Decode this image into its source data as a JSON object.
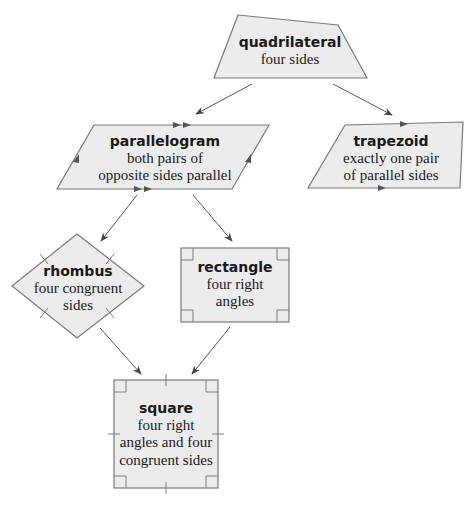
{
  "colors": {
    "fill": "#ececec",
    "stroke": "#7a7a7a",
    "arrow": "#555555",
    "text": "#1a1a1a"
  },
  "nodes": {
    "quadrilateral": {
      "title": "quadrilateral",
      "desc": [
        "four sides"
      ]
    },
    "parallelogram": {
      "title": "parallelogram",
      "desc": [
        "both pairs of",
        "opposite sides parallel"
      ]
    },
    "trapezoid": {
      "title": "trapezoid",
      "desc": [
        "exactly one pair",
        "of parallel sides"
      ]
    },
    "rhombus": {
      "title": "rhombus",
      "desc": [
        "four congruent",
        "sides"
      ]
    },
    "rectangle": {
      "title": "rectangle",
      "desc": [
        "four right",
        "angles"
      ]
    },
    "square": {
      "title": "square",
      "desc": [
        "four right",
        "angles and four",
        "congruent sides"
      ]
    }
  },
  "edges": [
    {
      "from": "quadrilateral",
      "to": "parallelogram"
    },
    {
      "from": "quadrilateral",
      "to": "trapezoid"
    },
    {
      "from": "parallelogram",
      "to": "rhombus"
    },
    {
      "from": "parallelogram",
      "to": "rectangle"
    },
    {
      "from": "rhombus",
      "to": "square"
    },
    {
      "from": "rectangle",
      "to": "square"
    }
  ]
}
